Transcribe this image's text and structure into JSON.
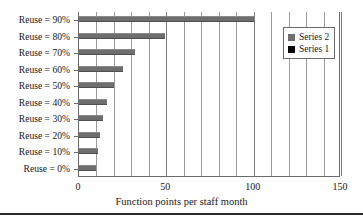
{
  "chart_data": {
    "type": "bar",
    "orientation": "horizontal",
    "title": "",
    "xlabel": "Function points per staff month",
    "ylabel": "",
    "categories": [
      "Reuse = 90%",
      "Reuse = 80%",
      "Reuse = 70%",
      "Reuse = 60%",
      "Reuse = 50%",
      "Reuse = 40%",
      "Reuse = 30%",
      "Reuse = 20%",
      "Reuse = 10%",
      "Reuse = 0%"
    ],
    "series": [
      {
        "name": "Series 2",
        "color": "#6e6e6e",
        "values": [
          100,
          49,
          32,
          25,
          20,
          16,
          14,
          12,
          11,
          10
        ]
      },
      {
        "name": "Series 1",
        "color": "#000000",
        "values": [
          0,
          0,
          0,
          0,
          0,
          0,
          0,
          0,
          0,
          0
        ]
      }
    ],
    "xlim": [
      0,
      150
    ],
    "xticks": [
      0,
      50,
      100,
      150
    ],
    "xtick_labels": [
      "0",
      "50",
      "100",
      "150"
    ],
    "minor_tick_step": 10,
    "grid": "vertical-minor-and-major",
    "legend": {
      "position": "top-right",
      "entries": [
        {
          "label": "Series 2",
          "color": "#6e6e6e"
        },
        {
          "label": "Series 1",
          "color": "#000000"
        }
      ]
    }
  }
}
